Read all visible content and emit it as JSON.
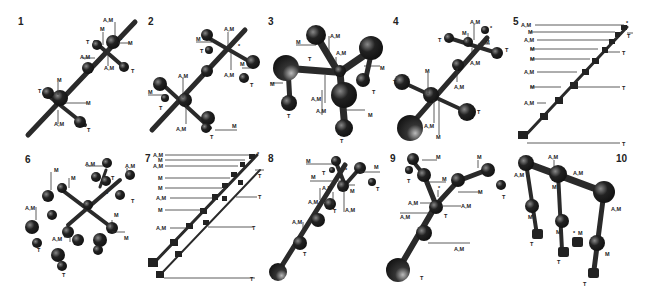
{
  "figure": {
    "panels": [
      {
        "number": "1",
        "labels": [
          "A,M",
          "M",
          "T",
          "M",
          "A,M",
          "A,M",
          "T",
          "M",
          "T",
          "M",
          "A,M",
          "T"
        ],
        "marker": "*"
      },
      {
        "number": "2",
        "labels": [
          "A,M",
          "M",
          "T",
          "M",
          "A,M",
          "T",
          "A,M",
          "M",
          "T",
          "A,M",
          "M",
          "T"
        ],
        "marker": "*"
      },
      {
        "number": "3",
        "labels": [
          "A,M",
          "M",
          "A,M",
          "T",
          "M",
          "M",
          "T",
          "A,M",
          "A,M",
          "T",
          "M",
          "T"
        ],
        "marker": "*"
      },
      {
        "number": "4",
        "labels": [
          "A,M",
          "M",
          "T",
          "M",
          "T",
          "A,M",
          "A,M",
          "T",
          "M",
          "T",
          "A,M",
          "M"
        ],
        "marker": "*"
      },
      {
        "number": "5",
        "labels": [
          "A,M",
          "M",
          "A,M",
          "M",
          "M",
          "A,M",
          "M",
          "A,M",
          "T",
          "T",
          "T",
          "T"
        ],
        "marker": "*"
      },
      {
        "number": "6",
        "labels": [
          "A,M",
          "A,M",
          "M",
          "M",
          "T",
          "T",
          "A,M",
          "M",
          "M",
          "A,M",
          "T",
          "T"
        ],
        "marker": "*"
      },
      {
        "number": "7",
        "labels": [
          "A,M",
          "M",
          "A,M",
          "M",
          "M",
          "A,M",
          "M",
          "A,M",
          "T",
          "T",
          "T",
          "T"
        ],
        "marker": "*"
      },
      {
        "number": "8",
        "labels": [
          "M",
          "T",
          "M",
          "M",
          "A,M",
          "M",
          "T",
          "A,M",
          "T",
          "A,M",
          "A,M",
          "T"
        ],
        "marker": "*"
      },
      {
        "number": "9",
        "labels": [
          "M",
          "T",
          "M",
          "M",
          "M",
          "T",
          "A,M",
          "A,M",
          "A,M",
          "T",
          "A,M",
          "T"
        ],
        "marker": "*"
      },
      {
        "number": "10",
        "labels": [
          "A,M",
          "A,M",
          "A,M",
          "A,M",
          "M",
          "M",
          "M",
          "M",
          "M",
          "T",
          "T",
          "T",
          "T"
        ],
        "marker": "*"
      }
    ]
  }
}
